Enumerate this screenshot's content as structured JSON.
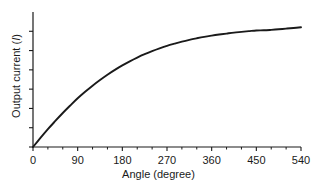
{
  "chart_data": {
    "type": "line",
    "title": "",
    "subtitle": "",
    "xlabel": "Angle (degree)",
    "ylabel": "Output current (I)",
    "ylabel_parts": {
      "text": "Output current (",
      "italic": "I",
      "tail": ")"
    },
    "xlim": [
      0,
      540
    ],
    "ylim": [
      0,
      1.12
    ],
    "xticks": [
      0,
      90,
      180,
      270,
      360,
      450,
      540
    ],
    "xticklabels": [
      "0",
      "90",
      "180",
      "270",
      "360",
      "450",
      "540"
    ],
    "x_minor_tick_interval": 30,
    "yticks": [
      0,
      0.16,
      0.32,
      0.48,
      0.64,
      0.8,
      0.96
    ],
    "yticklabels": [
      "",
      "",
      "",
      "",
      "",
      "",
      ""
    ],
    "grid": false,
    "legend": false,
    "legend_position": "none",
    "line_color": "#1a1a1a",
    "line_width": 1.9,
    "series": [
      {
        "name": "Output current vs angle",
        "x": [
          0,
          15,
          30,
          45,
          60,
          75,
          90,
          105,
          120,
          135,
          150,
          165,
          180,
          195,
          210,
          225,
          240,
          255,
          270,
          285,
          300,
          315,
          330,
          345,
          360,
          375,
          390,
          405,
          420,
          435,
          450,
          465,
          480,
          495,
          510,
          525,
          540
        ],
        "y": [
          0.0,
          0.075,
          0.148,
          0.216,
          0.282,
          0.344,
          0.404,
          0.458,
          0.509,
          0.556,
          0.6,
          0.64,
          0.677,
          0.711,
          0.742,
          0.77,
          0.795,
          0.818,
          0.839,
          0.857,
          0.874,
          0.889,
          0.902,
          0.914,
          0.924,
          0.933,
          0.941,
          0.949,
          0.955,
          0.961,
          0.967,
          0.968,
          0.972,
          0.977,
          0.982,
          0.987,
          0.993
        ]
      }
    ],
    "annotations": []
  },
  "axes": {
    "x_tick_labels": [
      "0",
      "90",
      "180",
      "270",
      "360",
      "450",
      "540"
    ]
  }
}
